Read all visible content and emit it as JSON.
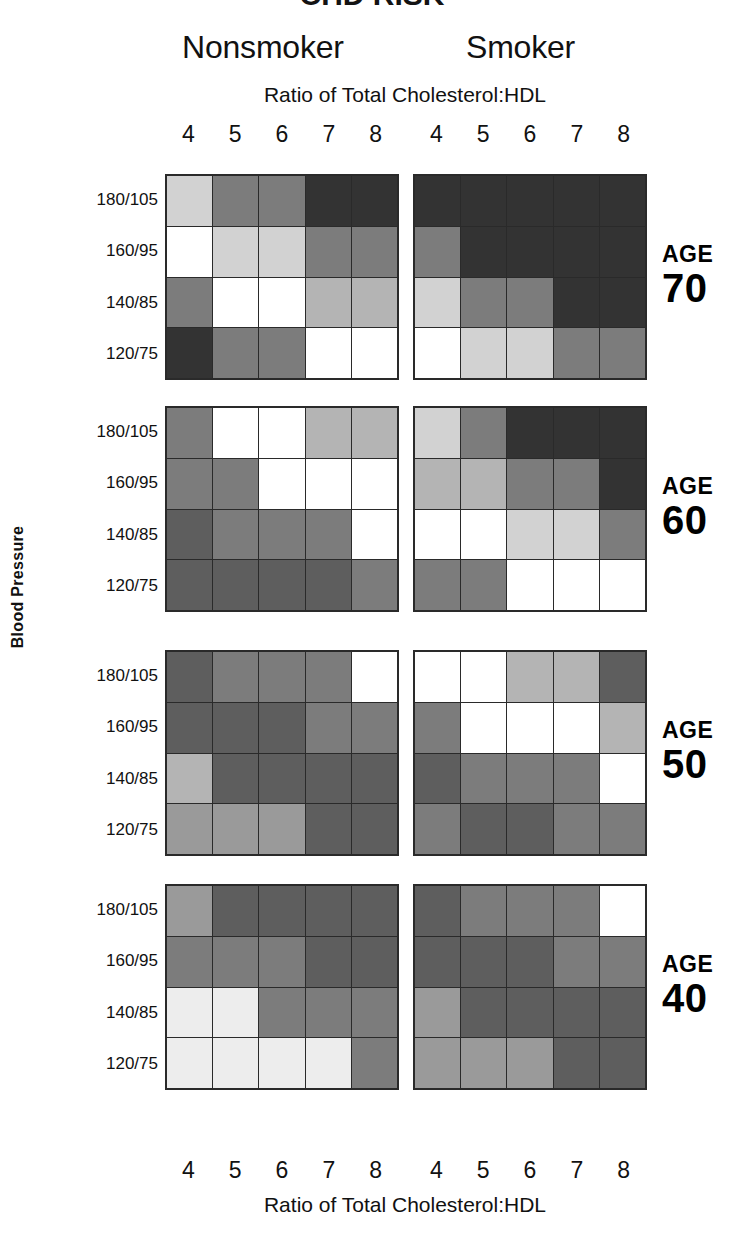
{
  "figure": {
    "cropped_top_title": "CHD RISK",
    "panels": [
      {
        "key": "nonsmoker",
        "label": "Nonsmoker"
      },
      {
        "key": "smoker",
        "label": "Smoker"
      }
    ],
    "x_axis_title_top": "Ratio of Total Cholesterol:HDL",
    "x_axis_title_bottom": "Ratio of Total Cholesterol:HDL",
    "y_axis_title": "Blood Pressure",
    "x_tick_labels": [
      "4",
      "5",
      "6",
      "7",
      "8"
    ],
    "y_tick_labels": [
      "180/105",
      "160/95",
      "140/85",
      "120/75"
    ],
    "age_word": "AGE",
    "age_values": [
      "70",
      "60",
      "50",
      "40"
    ]
  },
  "chart_data": {
    "type": "heatmap",
    "title": "CHD RISK",
    "xlabel": "Ratio of Total Cholesterol:HDL",
    "ylabel": "Blood Pressure",
    "grid": true,
    "legend_position": "none",
    "x": [
      "4",
      "5",
      "6",
      "7",
      "8"
    ],
    "y": [
      "180/105",
      "160/95",
      "140/85",
      "120/75"
    ],
    "value_scale": {
      "description": "Greyscale risk shading: 0 = lowest risk (white), 7 = highest risk (near-black)",
      "levels": [
        0,
        1,
        2,
        3,
        4,
        5,
        6,
        7
      ],
      "colors": [
        "#ffffff",
        "#ededed",
        "#d2d2d2",
        "#b4b4b4",
        "#9a9a9a",
        "#7c7c7c",
        "#5e5e5e",
        "#333333"
      ]
    },
    "panels": [
      {
        "age": "70",
        "smoker": false,
        "name": "Age 70 — Nonsmoker",
        "rows": [
          {
            "bp": "180/105",
            "values": [
              2,
              5,
              5,
              7,
              7
            ]
          },
          {
            "bp": "160/95",
            "values": [
              0,
              2,
              2,
              5,
              5
            ]
          },
          {
            "bp": "140/85",
            "values": [
              5,
              0,
              0,
              3,
              3
            ]
          },
          {
            "bp": "120/75",
            "values": [
              7,
              5,
              5,
              0,
              0
            ]
          }
        ]
      },
      {
        "age": "70",
        "smoker": true,
        "name": "Age 70 — Smoker",
        "rows": [
          {
            "bp": "180/105",
            "values": [
              7,
              7,
              7,
              7,
              7
            ]
          },
          {
            "bp": "160/95",
            "values": [
              5,
              7,
              7,
              7,
              7
            ]
          },
          {
            "bp": "140/85",
            "values": [
              2,
              5,
              5,
              7,
              7
            ]
          },
          {
            "bp": "120/75",
            "values": [
              0,
              2,
              2,
              5,
              5
            ]
          }
        ]
      },
      {
        "age": "60",
        "smoker": false,
        "name": "Age 60 — Nonsmoker",
        "rows": [
          {
            "bp": "180/105",
            "values": [
              5,
              0,
              0,
              3,
              3
            ]
          },
          {
            "bp": "160/95",
            "values": [
              5,
              5,
              0,
              0,
              0
            ]
          },
          {
            "bp": "140/85",
            "values": [
              6,
              5,
              5,
              5,
              0
            ]
          },
          {
            "bp": "120/75",
            "values": [
              6,
              6,
              6,
              6,
              5
            ]
          }
        ]
      },
      {
        "age": "60",
        "smoker": true,
        "name": "Age 60 — Smoker",
        "rows": [
          {
            "bp": "180/105",
            "values": [
              2,
              5,
              7,
              7,
              7
            ]
          },
          {
            "bp": "160/95",
            "values": [
              3,
              3,
              5,
              5,
              7
            ]
          },
          {
            "bp": "140/85",
            "values": [
              0,
              0,
              2,
              2,
              5
            ]
          },
          {
            "bp": "120/75",
            "values": [
              5,
              5,
              0,
              0,
              0
            ]
          }
        ]
      },
      {
        "age": "50",
        "smoker": false,
        "name": "Age 50 — Nonsmoker",
        "rows": [
          {
            "bp": "180/105",
            "values": [
              6,
              5,
              5,
              5,
              0
            ]
          },
          {
            "bp": "160/95",
            "values": [
              6,
              6,
              6,
              5,
              5
            ]
          },
          {
            "bp": "140/85",
            "values": [
              3,
              6,
              6,
              6,
              6
            ]
          },
          {
            "bp": "120/75",
            "values": [
              4,
              4,
              4,
              6,
              6
            ]
          }
        ]
      },
      {
        "age": "50",
        "smoker": true,
        "name": "Age 50 — Smoker",
        "rows": [
          {
            "bp": "180/105",
            "values": [
              0,
              0,
              3,
              3,
              6
            ]
          },
          {
            "bp": "160/95",
            "values": [
              5,
              0,
              0,
              0,
              3
            ]
          },
          {
            "bp": "140/85",
            "values": [
              6,
              5,
              5,
              5,
              0
            ]
          },
          {
            "bp": "120/75",
            "values": [
              5,
              6,
              6,
              5,
              5
            ]
          }
        ]
      },
      {
        "age": "40",
        "smoker": false,
        "name": "Age 40 — Nonsmoker",
        "rows": [
          {
            "bp": "180/105",
            "values": [
              4,
              6,
              6,
              6,
              6
            ]
          },
          {
            "bp": "160/95",
            "values": [
              5,
              5,
              5,
              6,
              6
            ]
          },
          {
            "bp": "140/85",
            "values": [
              1,
              1,
              5,
              5,
              5
            ]
          },
          {
            "bp": "120/75",
            "values": [
              1,
              1,
              1,
              1,
              5
            ]
          }
        ]
      },
      {
        "age": "40",
        "smoker": true,
        "name": "Age 40 — Smoker",
        "rows": [
          {
            "bp": "180/105",
            "values": [
              6,
              5,
              5,
              5,
              0
            ]
          },
          {
            "bp": "160/95",
            "values": [
              6,
              6,
              6,
              5,
              5
            ]
          },
          {
            "bp": "140/85",
            "values": [
              4,
              6,
              6,
              6,
              6
            ]
          },
          {
            "bp": "120/75",
            "values": [
              4,
              4,
              4,
              6,
              6
            ]
          }
        ]
      }
    ]
  },
  "layout": {
    "blocks": [
      {
        "age_index": 0,
        "top": 174,
        "height": 206
      },
      {
        "age_index": 1,
        "top": 406,
        "height": 206
      },
      {
        "age_index": 2,
        "top": 650,
        "height": 206
      },
      {
        "age_index": 3,
        "top": 884,
        "height": 206
      }
    ]
  }
}
